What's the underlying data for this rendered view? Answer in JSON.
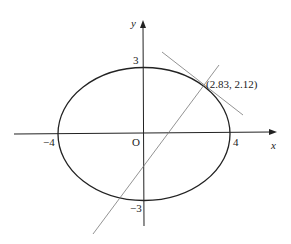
{
  "diagram": {
    "type": "ellipse-with-lines",
    "equation_hint": "x^2/16 + y^2/9 = 1",
    "axes": {
      "x_label": "x",
      "y_label": "y",
      "origin_label": "O"
    },
    "ticks": {
      "x_neg": "−4",
      "x_pos": "4",
      "y_pos": "3",
      "y_neg": "−3"
    },
    "point": {
      "label": "(2.83, 2.12)",
      "x": 2.83,
      "y": 2.12
    },
    "lines": [
      {
        "name": "tangent-line",
        "through": [
          2.83,
          2.12
        ]
      },
      {
        "name": "secant-line",
        "through": [
          2.83,
          2.12
        ]
      }
    ],
    "colors": {
      "curve": "#222222",
      "axes": "#222222",
      "lines": "#777777"
    }
  }
}
